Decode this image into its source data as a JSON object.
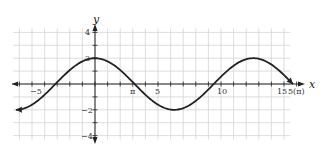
{
  "chart_data": {
    "type": "line",
    "title": "",
    "xlabel": "x",
    "ylabel": "y",
    "xlim": [
      -6.5,
      16.5
    ],
    "ylim": [
      -4,
      4
    ],
    "grid": true,
    "x_tick_labels": [
      "-5",
      "π",
      "5",
      "10",
      "15",
      "5(π)"
    ],
    "y_tick_labels": [
      "4",
      "2",
      "-2",
      "-4"
    ],
    "function": "y = 2cos(x/2)",
    "series": [
      {
        "name": "curve",
        "x": [
          -6.28,
          -4.71,
          -3.14,
          -1.57,
          0,
          1.57,
          3.14,
          4.71,
          6.28,
          7.85,
          9.42,
          10.99,
          12.57,
          14.14,
          15.71
        ],
        "y": [
          -2,
          -1.41,
          0,
          1.41,
          2,
          1.41,
          0,
          -1.41,
          -2,
          -1.41,
          0,
          1.41,
          2,
          1.41,
          0
        ]
      }
    ],
    "annotations": [
      "arrow at left end (-2π, -2)",
      "arrow at right end (5π, 0)"
    ]
  },
  "labels": {
    "x_axis": "x",
    "y_axis": "y",
    "x_neg5": "−5",
    "x_pi": "π",
    "x_5": "5",
    "x_10": "10",
    "x_15": "15",
    "x_5pi": "5(π)",
    "y_4": "4",
    "y_2": "2",
    "y_neg2": "−2",
    "y_neg4": "−4"
  }
}
